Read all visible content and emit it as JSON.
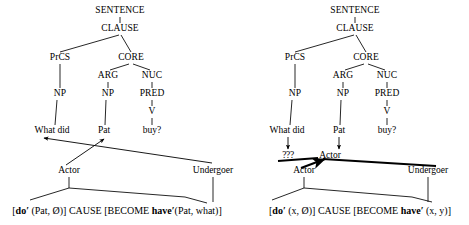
{
  "figure": {
    "type": "rrg-syntax-tree-pair",
    "background_color": "#ffffff",
    "line_color": "#000000"
  },
  "trees": [
    {
      "id": "left-tree",
      "name": "left-tree",
      "nodes": [
        {
          "label": "SENTENCE",
          "x": 120,
          "y": 11
        },
        {
          "label": "CLAUSE",
          "x": 120,
          "y": 29
        },
        {
          "label": "PrCS",
          "x": 60,
          "y": 58
        },
        {
          "label": "CORE",
          "x": 131,
          "y": 58
        },
        {
          "label": "ARG",
          "x": 108,
          "y": 76
        },
        {
          "label": "NUC",
          "x": 152,
          "y": 76
        },
        {
          "label": "NP",
          "x": 60,
          "y": 94
        },
        {
          "label": "NP",
          "x": 108,
          "y": 94
        },
        {
          "label": "PRED",
          "x": 152,
          "y": 94
        },
        {
          "label": "V",
          "x": 152,
          "y": 112
        }
      ],
      "words": [
        {
          "label": "What did",
          "x": 52,
          "y": 131
        },
        {
          "label": "Pat",
          "x": 104,
          "y": 131
        },
        {
          "label": "buy?",
          "x": 152,
          "y": 131
        }
      ],
      "roles": [
        {
          "label": "Actor",
          "x": 69,
          "y": 171
        },
        {
          "label": "Undergoer",
          "x": 213,
          "y": 171
        }
      ],
      "logical_structure": "[do′ (Pat, Ø)] CAUSE [BECOME have′(Pat, what)]",
      "logical_structure_parts": [
        {
          "text": "[",
          "bold": false
        },
        {
          "text": "do′",
          "bold": true
        },
        {
          "text": " (Pat, Ø)] CAUSE [BECOME ",
          "bold": false
        },
        {
          "text": "have′",
          "bold": true
        },
        {
          "text": "(Pat, what)]",
          "bold": false
        }
      ],
      "logical_structure_x": 117,
      "logical_structure_y": 211
    },
    {
      "id": "right-tree",
      "name": "right-tree",
      "nodes": [
        {
          "label": "SENTENCE",
          "x": 355,
          "y": 11
        },
        {
          "label": "CLAUSE",
          "x": 355,
          "y": 29
        },
        {
          "label": "PrCS",
          "x": 295,
          "y": 58
        },
        {
          "label": "CORE",
          "x": 366,
          "y": 58
        },
        {
          "label": "ARG",
          "x": 343,
          "y": 76
        },
        {
          "label": "NUC",
          "x": 387,
          "y": 76
        },
        {
          "label": "NP",
          "x": 295,
          "y": 94
        },
        {
          "label": "NP",
          "x": 343,
          "y": 94
        },
        {
          "label": "PRED",
          "x": 387,
          "y": 94
        },
        {
          "label": "V",
          "x": 387,
          "y": 112
        }
      ],
      "words": [
        {
          "label": "What did",
          "x": 287,
          "y": 131
        },
        {
          "label": "Pat",
          "x": 339,
          "y": 131
        },
        {
          "label": "buy?",
          "x": 387,
          "y": 131
        }
      ],
      "mid_labels": [
        {
          "label": "???",
          "x": 288,
          "y": 156
        },
        {
          "label": "Actor",
          "x": 330,
          "y": 156
        }
      ],
      "roles": [
        {
          "label": "Actor",
          "x": 304,
          "y": 171
        },
        {
          "label": "Undergoer",
          "x": 428,
          "y": 171
        }
      ],
      "logical_structure": "[do′ (x, Ø)] CAUSE [BECOME have′ (x, y)]",
      "logical_structure_parts": [
        {
          "text": "[",
          "bold": false
        },
        {
          "text": "do′",
          "bold": true
        },
        {
          "text": " (x, Ø)] CAUSE [BECOME ",
          "bold": false
        },
        {
          "text": "have′",
          "bold": true
        },
        {
          "text": " (x, y)]",
          "bold": false
        }
      ],
      "logical_structure_x": 360,
      "logical_structure_y": 211
    }
  ]
}
